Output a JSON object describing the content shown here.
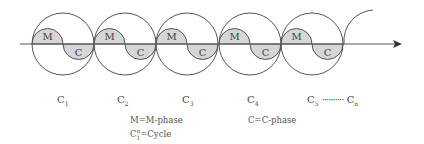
{
  "diagram": {
    "colors": {
      "stroke": "#555555",
      "fill": "#d6d6d6",
      "text": "#444444"
    },
    "axis": {
      "y": 44,
      "x_start": 20,
      "x_end": 400
    },
    "circles": [
      {
        "cx": 63,
        "cy": 44,
        "r": 31,
        "m_label": "M",
        "c_label": "C",
        "name": "C",
        "sub": "1"
      },
      {
        "cx": 125,
        "cy": 44,
        "r": 31,
        "m_label": "M",
        "c_label": "C",
        "name": "C",
        "sub": "2"
      },
      {
        "cx": 187,
        "cy": 44,
        "r": 31,
        "m_label": "M",
        "c_label": "C",
        "name": "C",
        "sub": "3"
      },
      {
        "cx": 250,
        "cy": 44,
        "r": 31,
        "m_label": "M",
        "c_label": "C",
        "name": "C",
        "sub": "4"
      },
      {
        "cx": 312,
        "cy": 44,
        "r": 31,
        "m_label": "M",
        "c_label": "C",
        "name": "C",
        "sub": "5"
      }
    ],
    "cycle_labels": [
      {
        "text": "C",
        "sub": "1"
      },
      {
        "text": "C",
        "sub": "2"
      },
      {
        "text": "C",
        "sub": "3"
      },
      {
        "text": "C",
        "sub": "4"
      },
      {
        "text": "C",
        "sub": "5"
      }
    ],
    "continuation": {
      "dots": "··········",
      "last_text": "C",
      "last_sub": "n"
    },
    "legend": {
      "m_phase": "M=M-phase",
      "cycle_prefix": "C",
      "cycle_sup": "n",
      "cycle_sub": "1",
      "cycle_suffix": "=Cycle",
      "c_phase": "C=C-phase"
    }
  }
}
